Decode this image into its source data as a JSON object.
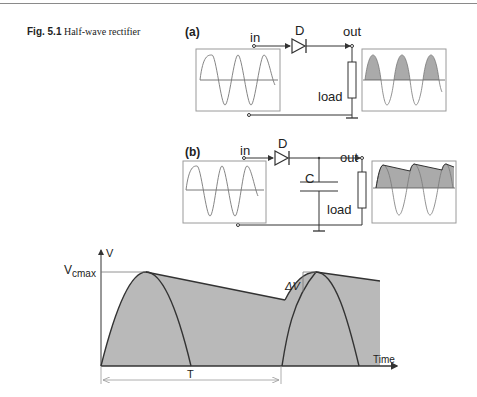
{
  "caption": {
    "fig_label": "Fig. 5.1",
    "title": "Half-wave rectifier"
  },
  "circuit_a": {
    "label": "(a)",
    "in": "in",
    "diode": "D",
    "out": "out",
    "load": "load"
  },
  "circuit_b": {
    "label": "(b)",
    "in": "in",
    "diode": "D",
    "capacitor": "C",
    "out": "out",
    "load": "load"
  },
  "waveform": {
    "y_axis": "V",
    "vmax_label": "V",
    "vmax_sub": "cmax",
    "ripple_label": "ΔV",
    "x_axis": "Time",
    "period_label": "T"
  },
  "colors": {
    "fill": "#b9b9b9",
    "line": "#333333",
    "box": "#9a9a9a"
  }
}
